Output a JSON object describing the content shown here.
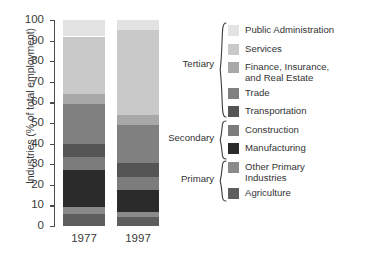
{
  "chart_data": {
    "type": "bar",
    "title": "",
    "subtitle": "",
    "stacked": true,
    "percent": true,
    "xlabel": "",
    "ylabel": "Industries (% of total employment)",
    "ylim": [
      0,
      100
    ],
    "yticks": [
      0,
      10,
      20,
      30,
      40,
      50,
      60,
      70,
      80,
      90,
      100
    ],
    "ytick_labels": [
      "0",
      "10",
      "20",
      "30",
      "40",
      "50",
      "60",
      "70",
      "80",
      "90",
      "100"
    ],
    "grid": false,
    "legend_position": "right",
    "categories": [
      "1977",
      "1997"
    ],
    "series": [
      {
        "name": "Agriculture",
        "group": "Primary",
        "color": "#5e5e5e",
        "values": [
          6.0,
          4.5
        ]
      },
      {
        "name": "Other Primary\nIndustries",
        "group": "Primary",
        "color": "#8a8a8a",
        "values": [
          3.0,
          2.5
        ]
      },
      {
        "name": "Manufacturing",
        "group": "Secondary",
        "color": "#2b2b2b",
        "values": [
          18.0,
          10.5
        ]
      },
      {
        "name": "Construction",
        "group": "Secondary",
        "color": "#7c7c7c",
        "values": [
          6.5,
          6.5
        ]
      },
      {
        "name": "Transportation",
        "group": "Tertiary",
        "color": "#555555",
        "values": [
          6.5,
          6.5
        ]
      },
      {
        "name": "Trade",
        "group": "Tertiary",
        "color": "#808080",
        "values": [
          19.0,
          18.5
        ]
      },
      {
        "name": "Finance, Insurance,\nand Real Estate",
        "group": "Tertiary",
        "color": "#a8a8a8",
        "values": [
          5.0,
          5.0
        ]
      },
      {
        "name": "Services",
        "group": "Tertiary",
        "color": "#c9c9c9",
        "values": [
          28.0,
          41.0
        ]
      },
      {
        "name": "Public Administration",
        "group": "Tertiary",
        "color": "#e3e3e3",
        "values": [
          8.0,
          5.0
        ]
      }
    ],
    "annotations": []
  },
  "axis": {
    "y_title": "Industries (% of total employment)",
    "ticks": [
      "100",
      "90",
      "80",
      "70",
      "60",
      "50",
      "40",
      "30",
      "20",
      "10",
      "0"
    ]
  },
  "bars": [
    {
      "label": "1977"
    },
    {
      "label": "1997"
    }
  ],
  "legend": {
    "entries": [
      {
        "label": "Public Administration",
        "color": "#e3e3e3"
      },
      {
        "label": "Services",
        "color": "#c9c9c9"
      },
      {
        "label": "Finance, Insurance,\nand Real Estate",
        "color": "#a8a8a8"
      },
      {
        "label": "Trade",
        "color": "#808080"
      },
      {
        "label": "Transportation",
        "color": "#555555"
      },
      {
        "label": "Construction",
        "color": "#7c7c7c"
      },
      {
        "label": "Manufacturing",
        "color": "#2b2b2b"
      },
      {
        "label": "Other Primary\nIndustries",
        "color": "#8a8a8a"
      },
      {
        "label": "Agriculture",
        "color": "#5e5e5e"
      }
    ],
    "groups": [
      {
        "label": "Tertiary"
      },
      {
        "label": "Secondary"
      },
      {
        "label": "Primary"
      }
    ]
  }
}
